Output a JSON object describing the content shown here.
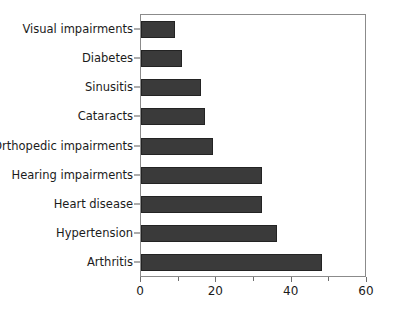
{
  "chart_data": {
    "type": "bar",
    "orientation": "horizontal",
    "title": "",
    "subtitle": "",
    "xlabel": "",
    "ylabel": "",
    "categories": [
      "Visual impairments",
      "Diabetes",
      "Sinusitis",
      "Cataracts",
      "Orthopedic impairments",
      "Hearing impairments",
      "Heart disease",
      "Hypertension",
      "Arthritis"
    ],
    "values": [
      9,
      11,
      16,
      17,
      19,
      32,
      32,
      36,
      48
    ],
    "xlim": [
      0,
      60
    ],
    "xticks": [
      0,
      20,
      40,
      60
    ],
    "xtick_labels": [
      "0",
      "20",
      "40",
      "60"
    ],
    "xticks_minor": [
      10,
      30,
      50
    ],
    "grid": false,
    "legend": false,
    "bar_color": "#3a3a3a",
    "bar_edge_color": "#232323",
    "axis_color": "#8b8b8b",
    "text_color": "#1b1b1b",
    "background_color": "#ffffff"
  }
}
